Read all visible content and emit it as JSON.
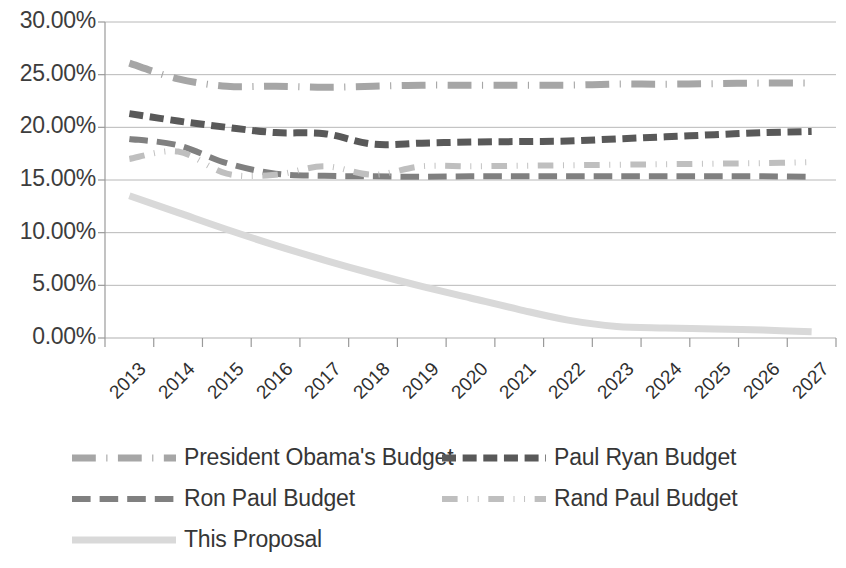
{
  "chart_data": {
    "type": "line",
    "title": "",
    "subtitle": "",
    "xlabel": "",
    "ylabel": "",
    "grid": true,
    "legend_position": "bottom",
    "ylim": [
      0,
      30
    ],
    "ytick_values": [
      0,
      5,
      10,
      15,
      20,
      25,
      30
    ],
    "ytick_labels": [
      "0.00%",
      "5.00%",
      "10.00%",
      "15.00%",
      "20.00%",
      "25.00%",
      "30.00%"
    ],
    "categories": [
      "2013",
      "2014",
      "2015",
      "2016",
      "2017",
      "2018",
      "2019",
      "2020",
      "2021",
      "2022",
      "2023",
      "2024",
      "2025",
      "2026",
      "2027"
    ],
    "series": [
      {
        "name": "President Obama's Budget",
        "color": "#A6A6A6",
        "dash": "dash-dot",
        "width": 7,
        "values": [
          26.1,
          24.6,
          23.9,
          23.9,
          23.8,
          23.9,
          24.0,
          24.0,
          24.0,
          24.0,
          24.1,
          24.1,
          24.15,
          24.2,
          24.2
        ]
      },
      {
        "name": "Paul Ryan Budget",
        "color": "#595959",
        "dash": "dash",
        "width": 7,
        "values": [
          21.3,
          20.6,
          20.0,
          19.5,
          19.4,
          18.4,
          18.5,
          18.6,
          18.65,
          18.7,
          18.9,
          19.1,
          19.3,
          19.5,
          19.6
        ]
      },
      {
        "name": "Ron Paul Budget",
        "color": "#808080",
        "dash": "dash-long",
        "width": 6,
        "values": [
          18.9,
          18.3,
          16.6,
          15.6,
          15.4,
          15.35,
          15.3,
          15.35,
          15.35,
          15.35,
          15.35,
          15.35,
          15.35,
          15.35,
          15.3
        ]
      },
      {
        "name": "Rand Paul Budget",
        "color": "#BFBFBF",
        "dash": "dash-dot-dot",
        "width": 6,
        "values": [
          17.0,
          17.7,
          15.6,
          15.5,
          16.3,
          15.5,
          16.3,
          16.3,
          16.35,
          16.4,
          16.45,
          16.5,
          16.55,
          16.6,
          16.7
        ]
      },
      {
        "name": "This Proposal",
        "color": "#D9D9D9",
        "dash": "solid",
        "width": 7,
        "values": [
          13.5,
          11.9,
          10.3,
          8.8,
          7.4,
          6.1,
          4.9,
          3.8,
          2.7,
          1.7,
          1.1,
          0.95,
          0.85,
          0.75,
          0.6
        ]
      }
    ]
  },
  "legend": {
    "items": [
      {
        "label": "President Obama's Budget"
      },
      {
        "label": "Paul Ryan Budget"
      },
      {
        "label": "Ron Paul Budget"
      },
      {
        "label": "Rand Paul Budget"
      },
      {
        "label": "This Proposal"
      }
    ]
  }
}
